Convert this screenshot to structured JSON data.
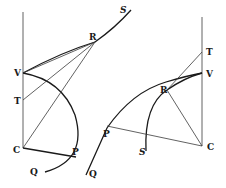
{
  "figure": {
    "type": "geometric-diagram",
    "colors": {
      "ink": "#1a1a1a",
      "background": "#ffffff"
    },
    "left": {
      "labels": {
        "S": "S",
        "R": "R",
        "V": "V",
        "T": "T",
        "C": "C",
        "P": "P",
        "Q": "Q"
      }
    },
    "right": {
      "labels": {
        "T": "T",
        "V": "V",
        "R": "R",
        "P": "P",
        "S": "S",
        "C": "C",
        "Q": "Q"
      }
    }
  }
}
